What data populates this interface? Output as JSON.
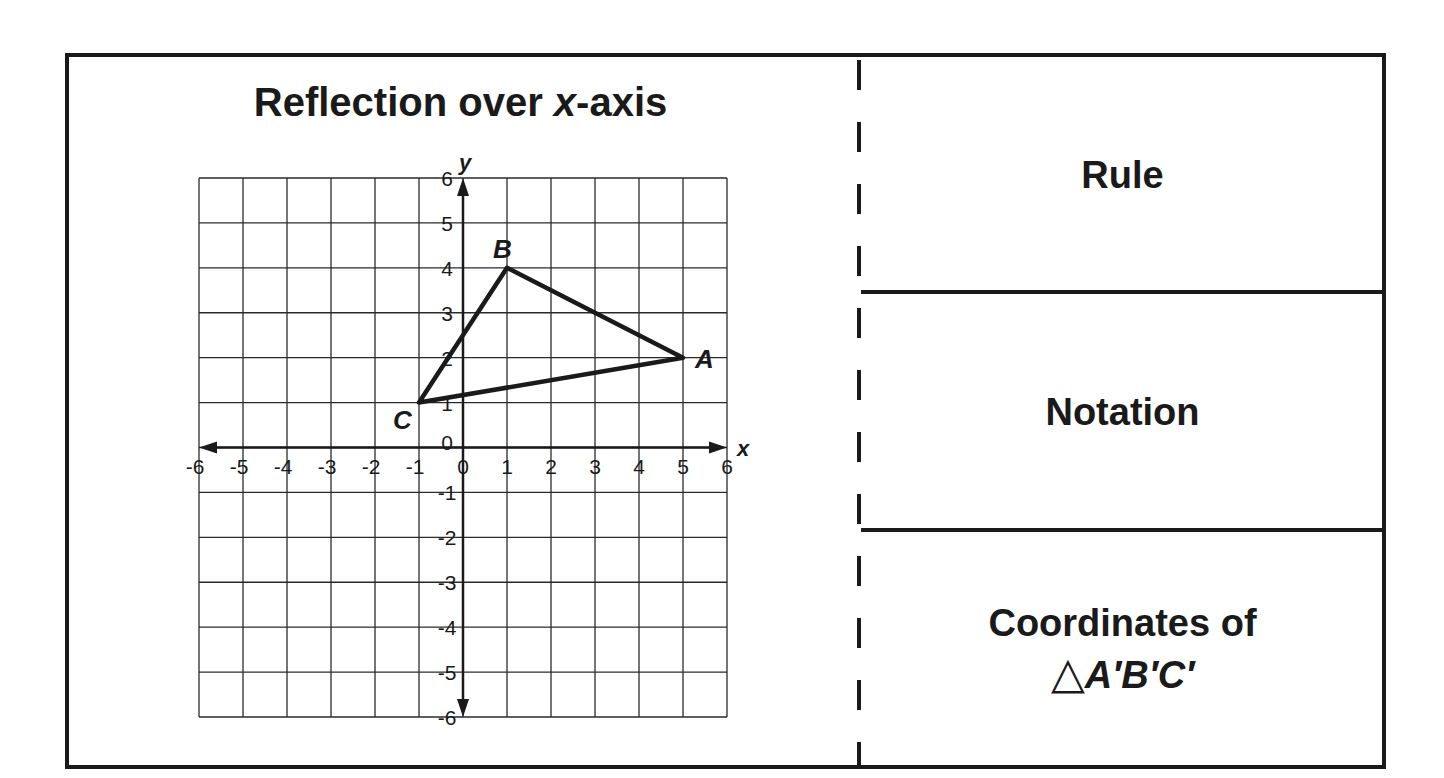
{
  "title": {
    "prefix": "Reflection over ",
    "var": "x",
    "suffix": "-axis"
  },
  "panels": [
    {
      "label": "Rule"
    },
    {
      "label": "Notation"
    },
    {
      "label_line1": "Coordinates of",
      "triangle_symbol": "△",
      "label_line2": "A′B′C′"
    }
  ],
  "chart_data": {
    "type": "scatter",
    "title": "Reflection over x-axis",
    "xlabel": "x",
    "ylabel": "y",
    "xlim": [
      -6,
      6
    ],
    "ylim": [
      -6,
      6
    ],
    "grid": true,
    "x_ticks": [
      "-6",
      "-5",
      "-4",
      "-3",
      "-2",
      "-1",
      "0",
      "1",
      "2",
      "3",
      "4",
      "5",
      "6"
    ],
    "y_ticks": [
      "-6",
      "-5",
      "-4",
      "-3",
      "-2",
      "-1",
      "0",
      "1",
      "2",
      "3",
      "4",
      "5",
      "6"
    ],
    "shapes": [
      {
        "kind": "triangle",
        "vertices": [
          {
            "label": "A",
            "x": 5,
            "y": 2
          },
          {
            "label": "B",
            "x": 1,
            "y": 4
          },
          {
            "label": "C",
            "x": -1,
            "y": 1
          }
        ]
      }
    ]
  },
  "colors": {
    "ink": "#1a1a1a",
    "background": "#ffffff"
  }
}
